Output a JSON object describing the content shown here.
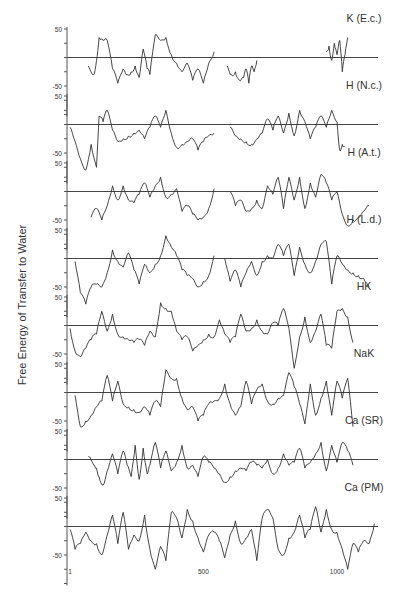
{
  "chart_data": {
    "type": "line",
    "title": "",
    "ylabel": "Free Energy of Transfer to Water",
    "xlabel": "",
    "x_ticks": [
      1,
      500,
      1000
    ],
    "y_ticks": [
      50,
      -50
    ],
    "ylim": [
      -100,
      50
    ],
    "xlim": [
      1,
      1150
    ],
    "grid": false,
    "layout": "8 vertically stacked panels sharing x-axis; horizontal zero line in each panel",
    "panels": [
      {
        "name": "K (E.c.)",
        "segments": [
          {
            "x": [
              70,
              90,
              100,
              110,
              125,
              140,
              160,
              180,
              200,
              215,
              230,
              245,
              260,
              275,
              290,
              300,
              320,
              340,
              360,
              380,
              400,
              420,
              440,
              460,
              480,
              500,
              520,
              540
            ],
            "y": [
              -15,
              -30,
              -5,
              35,
              30,
              30,
              -20,
              -45,
              -20,
              -30,
              -25,
              -15,
              -35,
              15,
              -20,
              -30,
              40,
              30,
              35,
              5,
              -10,
              -25,
              -10,
              -40,
              -20,
              -45,
              -10,
              10
            ]
          },
          {
            "x": [
              590,
              605,
              620,
              635,
              650,
              660,
              670,
              680,
              690,
              700
            ],
            "y": [
              -15,
              -30,
              -25,
              -40,
              -35,
              -20,
              -45,
              -15,
              -25,
              -5
            ]
          },
          {
            "x": [
              960,
              970,
              980,
              990,
              1000,
              1010,
              1020,
              1030,
              1040
            ],
            "y": [
              10,
              20,
              -5,
              25,
              5,
              30,
              -25,
              5,
              35
            ]
          }
        ]
      },
      {
        "name": "H (N.c.)",
        "segments": [
          {
            "x": [
              1,
              20,
              40,
              60,
              80,
              100,
              110,
              125,
              140,
              160,
              180,
              200,
              220,
              240,
              260,
              280,
              300,
              320,
              340,
              360,
              380,
              400,
              420,
              440,
              460,
              480,
              500,
              520,
              540
            ],
            "y": [
              -5,
              -30,
              -60,
              -80,
              -35,
              -75,
              15,
              5,
              25,
              -10,
              -30,
              -25,
              -20,
              -15,
              -10,
              -25,
              -5,
              15,
              -5,
              25,
              -15,
              -40,
              -35,
              -30,
              -25,
              -45,
              -30,
              -20,
              -15
            ]
          },
          {
            "x": [
              600,
              620,
              640,
              660,
              680,
              700,
              720,
              740,
              760,
              780,
              800,
              820,
              840,
              860,
              880,
              900,
              920,
              940,
              960,
              980,
              1000,
              1010,
              1020,
              1030
            ],
            "y": [
              -5,
              -20,
              -25,
              -30,
              -35,
              -25,
              -15,
              10,
              -10,
              15,
              -15,
              20,
              -20,
              25,
              5,
              -25,
              -5,
              15,
              -5,
              25,
              5,
              -45,
              -35,
              -40
            ]
          }
        ]
      },
      {
        "name": "H (A.t.)",
        "segments": [
          {
            "x": [
              80,
              100,
              120,
              140,
              160,
              180,
              200,
              220,
              240,
              260,
              280,
              300,
              320,
              340,
              360,
              380,
              400,
              420,
              440,
              460,
              480,
              500,
              520,
              540
            ],
            "y": [
              -45,
              -30,
              -50,
              -25,
              10,
              -15,
              10,
              -15,
              -20,
              -5,
              15,
              -10,
              10,
              25,
              -10,
              -5,
              5,
              -35,
              -25,
              -40,
              -50,
              -45,
              -30,
              5
            ]
          },
          {
            "x": [
              600,
              620,
              640,
              660,
              680,
              700,
              720,
              740,
              760,
              780,
              800,
              820,
              840,
              860,
              880,
              900,
              920,
              940,
              960,
              980,
              1000,
              1020,
              1040,
              1060,
              1080,
              1100,
              1120
            ],
            "y": [
              0,
              -25,
              -15,
              -35,
              -30,
              -15,
              -30,
              10,
              -5,
              25,
              -30,
              25,
              -15,
              25,
              -30,
              15,
              -10,
              30,
              15,
              -15,
              0,
              -40,
              -60,
              -50,
              -45,
              -35,
              -25
            ]
          }
        ]
      },
      {
        "name": "H (L.d.)",
        "segments": [
          {
            "x": [
              20,
              40,
              60,
              80,
              100,
              120,
              140,
              160,
              180,
              200,
              220,
              240,
              260,
              280,
              300,
              320,
              340,
              360,
              380,
              400,
              420,
              440,
              460,
              480,
              500,
              520,
              540
            ],
            "y": [
              -5,
              -60,
              -80,
              -50,
              -45,
              -50,
              -25,
              15,
              -5,
              -15,
              10,
              -20,
              -45,
              -10,
              -25,
              -10,
              5,
              40,
              20,
              5,
              -20,
              -30,
              -35,
              -50,
              -40,
              -30,
              5
            ]
          },
          {
            "x": [
              580,
              600,
              620,
              640,
              660,
              680,
              700,
              720,
              740,
              760,
              780,
              800,
              820,
              840,
              860,
              880,
              900,
              920,
              940,
              960,
              980,
              1000,
              1020,
              1040,
              1060,
              1080,
              1100,
              1120
            ],
            "y": [
              0,
              -40,
              -20,
              -50,
              -25,
              -5,
              -30,
              -5,
              5,
              0,
              25,
              5,
              25,
              -30,
              20,
              -10,
              -25,
              -5,
              25,
              30,
              -45,
              5,
              -10,
              -20,
              -25,
              -30,
              -35,
              -50
            ]
          }
        ]
      },
      {
        "name": "HK",
        "segments": [
          {
            "x": [
              1,
              20,
              40,
              60,
              80,
              100,
              120,
              140,
              160,
              180,
              200,
              220,
              240,
              260,
              280,
              300,
              320,
              340,
              360,
              380,
              400,
              420,
              440,
              460,
              480,
              500,
              520,
              540,
              560,
              580,
              600,
              620,
              640,
              660,
              680,
              700,
              720,
              740,
              760,
              780,
              800,
              820,
              840,
              860,
              880,
              900,
              920,
              940,
              960,
              980,
              1000,
              1020,
              1040,
              1060
            ],
            "y": [
              -5,
              -45,
              -55,
              -40,
              -25,
              -15,
              25,
              -10,
              20,
              -15,
              -20,
              -25,
              -30,
              -25,
              -35,
              -10,
              -20,
              40,
              30,
              25,
              -10,
              -25,
              -20,
              -45,
              -35,
              -25,
              -15,
              -20,
              10,
              -15,
              -30,
              -20,
              20,
              -10,
              -5,
              10,
              -10,
              -15,
              5,
              0,
              30,
              -5,
              -75,
              -20,
              15,
              -30,
              -10,
              20,
              -35,
              -40,
              25,
              30,
              15,
              -30
            ]
          }
        ]
      },
      {
        "name": "NaK",
        "segments": [
          {
            "x": [
              20,
              40,
              60,
              80,
              100,
              120,
              140,
              160,
              180,
              200,
              220,
              240,
              260,
              280,
              300,
              320,
              340,
              360,
              380,
              400,
              420,
              440,
              460,
              480,
              500,
              520,
              540,
              560,
              580,
              600,
              620,
              640,
              660,
              680,
              700,
              720,
              740,
              760,
              780,
              800,
              820,
              840,
              860,
              880,
              900,
              920,
              940,
              960,
              980,
              1000,
              1020,
              1040,
              1060
            ],
            "y": [
              -5,
              -60,
              -50,
              -40,
              -25,
              -15,
              30,
              -15,
              20,
              -20,
              -25,
              -30,
              -35,
              -25,
              -40,
              -15,
              -25,
              40,
              25,
              25,
              -10,
              -30,
              -25,
              -50,
              -40,
              -20,
              -15,
              -10,
              15,
              -20,
              -40,
              -25,
              20,
              -20,
              5,
              15,
              -15,
              -20,
              -10,
              -5,
              35,
              10,
              -20,
              -55,
              15,
              -40,
              -10,
              20,
              -40,
              20,
              -10,
              25,
              -60
            ]
          }
        ]
      },
      {
        "name": "Ca (SR)",
        "segments": [
          {
            "x": [
              70,
              90,
              100,
              110,
              125,
              140,
              160,
              180,
              200,
              215,
              230,
              245,
              260,
              275,
              290,
              300,
              320,
              340,
              360,
              380,
              400,
              420,
              440,
              460,
              480,
              500,
              520,
              540,
              560,
              580,
              600,
              620,
              640,
              660,
              680,
              700,
              720,
              740,
              760,
              780,
              800,
              820,
              840,
              860,
              880,
              900,
              920,
              940,
              960,
              980,
              1000,
              1020,
              1040,
              1060
            ],
            "y": [
              5,
              -10,
              -15,
              -30,
              -45,
              -20,
              10,
              -25,
              15,
              -10,
              -30,
              25,
              -35,
              20,
              -25,
              -10,
              30,
              -15,
              15,
              -20,
              -5,
              25,
              -15,
              -10,
              -30,
              5,
              -5,
              -15,
              -25,
              -40,
              -30,
              -20,
              -15,
              -20,
              -5,
              -10,
              -15,
              0,
              -25,
              -15,
              10,
              -10,
              -5,
              20,
              -15,
              -5,
              10,
              30,
              -20,
              25,
              -5,
              30,
              15,
              -10
            ]
          }
        ]
      },
      {
        "name": "Ca (PM)",
        "segments": [
          {
            "x": [
              1,
              20,
              40,
              60,
              80,
              100,
              120,
              140,
              160,
              180,
              200,
              220,
              240,
              260,
              280,
              300,
              320,
              340,
              360,
              380,
              400,
              420,
              440,
              460,
              480,
              500,
              520,
              540,
              560,
              580,
              600,
              620,
              640,
              660,
              680,
              700,
              720,
              740,
              760,
              780,
              800,
              820,
              840,
              860,
              880,
              900,
              920,
              940,
              960,
              980,
              1000,
              1020,
              1040,
              1060,
              1080,
              1100,
              1120,
              1140
            ],
            "y": [
              -5,
              -40,
              -30,
              -10,
              -25,
              -30,
              -50,
              -15,
              20,
              -30,
              25,
              -40,
              -15,
              -25,
              20,
              -40,
              -75,
              -35,
              -60,
              25,
              15,
              -20,
              30,
              10,
              -20,
              -45,
              -15,
              -10,
              -25,
              -55,
              -15,
              10,
              -30,
              -20,
              -5,
              -60,
              15,
              30,
              15,
              -40,
              -50,
              -20,
              -10,
              20,
              -20,
              -5,
              35,
              -10,
              30,
              -5,
              -10,
              -40,
              -75,
              -30,
              -45,
              -25,
              -30,
              5
            ]
          }
        ]
      }
    ]
  },
  "panels_labels": [
    "K (E.c.)",
    "H (N.c.)",
    "H (A.t.)",
    "H (L.d.)",
    "HK",
    "NaK",
    "Ca (SR)",
    "Ca (PM)"
  ],
  "axis": {
    "ylabel": "Free Energy of Transfer to Water",
    "y_tick_top": "50",
    "y_tick_bottom": "-50",
    "x_tick_labels": [
      "1",
      "500",
      "1000"
    ]
  },
  "colors": {
    "line": "#333333",
    "zero_line": "#444444",
    "axis": "#555555",
    "text": "#333333"
  }
}
